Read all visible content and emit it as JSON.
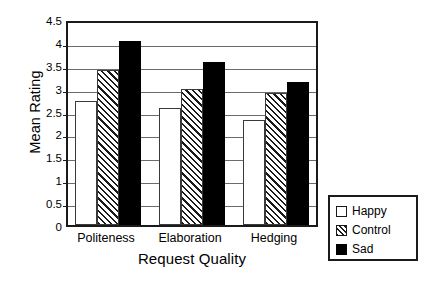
{
  "chart_data": {
    "type": "bar",
    "title": "",
    "subtitle": "",
    "xlabel": "Request Quality",
    "ylabel": "Mean Rating",
    "categories": [
      "Politeness",
      "Elaboration",
      "Hedging"
    ],
    "series": [
      {
        "name": "Happy",
        "values": [
          2.7,
          2.55,
          2.3
        ],
        "fill": "white",
        "color": "#ffffff"
      },
      {
        "name": "Control",
        "values": [
          3.38,
          2.98,
          2.88
        ],
        "fill": "hatch",
        "color": "#ffffff"
      },
      {
        "name": "Sad",
        "values": [
          4.02,
          3.57,
          3.12
        ],
        "fill": "solid",
        "color": "#000000"
      }
    ],
    "ylim": [
      0,
      4.5
    ],
    "yticks": [
      0,
      0.5,
      1,
      1.5,
      2,
      2.5,
      3,
      3.5,
      4,
      4.5
    ],
    "ytick_labels": [
      "0",
      "0.5",
      "1",
      "1.5",
      "2",
      "2.5",
      "3",
      "3.5",
      "4",
      "4.5"
    ],
    "grid": true,
    "grid_axis": "y",
    "legend_position": "outside-bottom-right",
    "frame_color": "#1a1a1a",
    "grid_color": "#6b6b6b",
    "background": "#ffffff"
  },
  "legend": {
    "entries": [
      {
        "label": "Happy"
      },
      {
        "label": "Control"
      },
      {
        "label": "Sad"
      }
    ]
  }
}
